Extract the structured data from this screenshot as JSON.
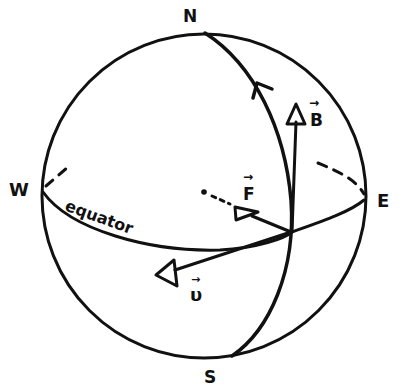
{
  "diagram": {
    "type": "globe-vector-diagram",
    "colors": {
      "ink": "#111111",
      "background": "#ffffff"
    },
    "labels": {
      "north": "N",
      "south": "S",
      "west": "W",
      "east": "E",
      "equator": "equator"
    },
    "vectors": [
      {
        "id": "B",
        "label": "B",
        "arrow_mark": "→",
        "direction": "north (up)"
      },
      {
        "id": "F",
        "label": "F",
        "arrow_mark": "→",
        "direction": "into page, toward west"
      },
      {
        "id": "v",
        "label": "υ",
        "arrow_mark": "→",
        "direction": "toward west, down"
      }
    ],
    "elements": [
      "sphere outline",
      "equator (front solid, back dashed)",
      "meridian with northward direction arrow",
      "vector origin at meridian-equator intersection"
    ]
  }
}
